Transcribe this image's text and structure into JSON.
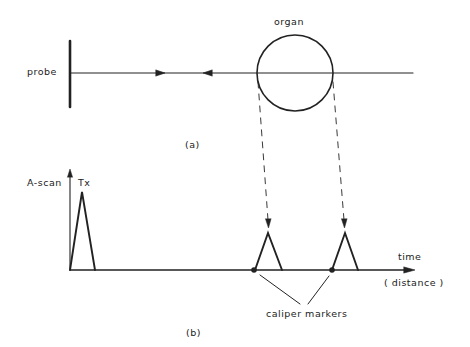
{
  "diagram": {
    "part_a": {
      "caption": "(a)",
      "probe_label": "probe",
      "organ_label": "organ"
    },
    "part_b": {
      "caption": "(b)",
      "y_axis_label": "A-scan",
      "transmit_pulse_label": "Tx",
      "x_axis_label": "time",
      "x_axis_sublabel": "( distance )",
      "caliper_label": "caliper markers"
    },
    "colors": {
      "ink": "#222222",
      "background": "#ffffff"
    }
  }
}
